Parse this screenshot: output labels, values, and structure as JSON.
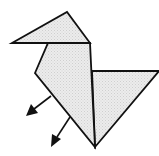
{
  "diagram": {
    "title": "Origami bird folding step",
    "fill_color": "#e6e6e6",
    "stroke_color": "#111111",
    "parts": {
      "head": {
        "points": "12,43 67,12 90,43"
      },
      "body": {
        "points": "48,43 90,43 95,147 35,73"
      },
      "tail": {
        "points": "92,71 159,71 95,147"
      }
    },
    "arrows": [
      {
        "from": [
          51,
          96
        ],
        "to": [
          30,
          112
        ]
      },
      {
        "from": [
          70,
          117
        ],
        "to": [
          53,
          143
        ]
      }
    ]
  }
}
